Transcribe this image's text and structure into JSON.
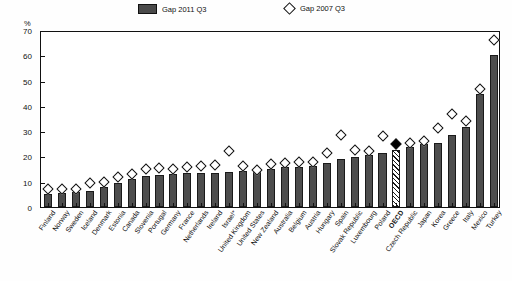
{
  "legend": {
    "series_a_label": "Gap 2011 Q3",
    "series_b_label": "Gap 2007 Q3",
    "swatch_a_icon": "filled-bar-swatch",
    "swatch_b_icon": "open-diamond-marker"
  },
  "axes": {
    "y_unit": "%",
    "y_ticks": [
      "0",
      "10",
      "20",
      "30",
      "40",
      "50",
      "60",
      "70"
    ]
  },
  "chart_data": {
    "type": "bar",
    "title": "",
    "subtitle": "",
    "xlabel": "",
    "ylabel": "%",
    "ylim": [
      0,
      70
    ],
    "ytick_values": [
      0,
      10,
      20,
      30,
      40,
      50,
      60,
      70
    ],
    "grid": false,
    "legend_position": "top",
    "highlight_category": "OECD",
    "categories": [
      "Finland",
      "Norway",
      "Sweden",
      "Iceland",
      "Denmark",
      "Estonia",
      "Canada",
      "Slovenia",
      "Portugal",
      "Germany",
      "France",
      "Netherlands",
      "Ireland",
      "Israel*",
      "United Kingdom",
      "United States",
      "New Zealand",
      "Australia",
      "Belgium",
      "Austria",
      "Hungary",
      "Spain",
      "Slovak Republic",
      "Luxembourg",
      "Poland",
      "OECD",
      "Czech Republic",
      "Japan",
      "Korea",
      "Greece",
      "Italy",
      "Mexico",
      "Turkey"
    ],
    "series": [
      {
        "name": "Gap 2011 Q3",
        "marker": "bar",
        "values": [
          5.2,
          5.6,
          5.8,
          6.3,
          7.8,
          9.3,
          11.0,
          12.2,
          12.6,
          12.9,
          13.3,
          13.6,
          13.6,
          13.7,
          14.4,
          14.8,
          15.2,
          15.8,
          16.0,
          16.2,
          17.6,
          18.8,
          19.8,
          20.4,
          21.2,
          22.5,
          23.6,
          24.8,
          25.2,
          28.5,
          31.6,
          44.6,
          60.2
        ]
      },
      {
        "name": "Gap 2007 Q3",
        "marker": "diamond",
        "values": [
          7.0,
          7.3,
          7.0,
          9.4,
          9.8,
          11.8,
          13.2,
          15.0,
          15.4,
          15.0,
          16.0,
          16.1,
          16.8,
          22.0,
          16.4,
          14.8,
          17.2,
          17.4,
          18.0,
          18.0,
          21.4,
          28.6,
          22.6,
          22.0,
          28.0,
          24.8,
          25.2,
          26.0,
          31.2,
          36.6,
          34.2,
          46.8,
          66.2
        ]
      }
    ]
  }
}
